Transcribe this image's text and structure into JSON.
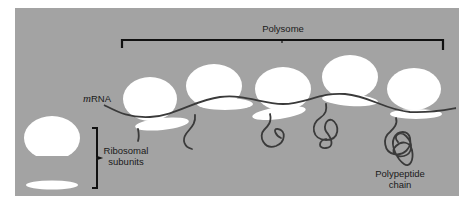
{
  "diagram": {
    "type": "biology-illustration",
    "colors": {
      "background": "#ffffff",
      "panel": "#a3a3a3",
      "ribosome": "#ffffff",
      "strand": "#3a3a3a",
      "bracket": "#111111",
      "text": "#1a1a1a"
    },
    "labels": {
      "polysome": "Polysome",
      "mrna_prefix": "m",
      "mrna_suffix": "RNA",
      "ribosomal_line1": "Ribosomal",
      "ribosomal_line2": "subunits",
      "polypeptide_line1": "Polypeptide",
      "polypeptide_line2": "chain"
    },
    "ribosomes_on_mrna": 5,
    "free_subunits": [
      "large subunit",
      "small subunit"
    ]
  }
}
